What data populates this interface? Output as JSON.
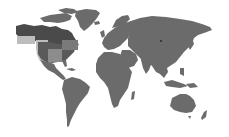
{
  "map": {
    "type": "world-map",
    "style": "grayscale",
    "colors": {
      "background": "#ffffff",
      "land": "#6b6b6b",
      "highlight_dark": "#4a4a4a",
      "highlight_light": "#bdbdbd",
      "highlight_mid": "#8c8c8c",
      "marker": "#3a3a3a"
    },
    "highlighted_regions": [
      {
        "name": "canada-alaska",
        "shade": "dark"
      },
      {
        "name": "western-pacific-overlay",
        "shade": "light"
      },
      {
        "name": "western-us",
        "shade": "light"
      },
      {
        "name": "central-us",
        "shade": "mid"
      },
      {
        "name": "northeast-us-canada",
        "shade": "mid"
      }
    ],
    "markers": [
      {
        "name": "russia-marker",
        "x": 161,
        "y": 41
      }
    ]
  }
}
